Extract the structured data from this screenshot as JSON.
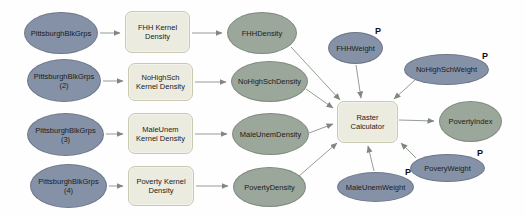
{
  "diagram": {
    "colors": {
      "input_fill": "#8591a6",
      "derived_fill": "#9aa79a",
      "tool_fill": "#ebebe0",
      "edge": "#929a92",
      "background": "#fefefe"
    },
    "nodes": {
      "pbg1": {
        "label": "PittsburghBlkGrps",
        "type": "input"
      },
      "pbg2": {
        "label": "PittsburghBlkGrps\n(2)",
        "type": "input"
      },
      "pbg3": {
        "label": "PittsburghBlkGrps\n(3)",
        "type": "input"
      },
      "pbg4": {
        "label": "PittsburghBlkGrps\n(4)",
        "type": "input"
      },
      "fhh_kd": {
        "label": "FHH Kernel\nDensity",
        "type": "tool"
      },
      "nhs_kd": {
        "label": "NoHighSch\nKernel Density",
        "type": "tool"
      },
      "mu_kd": {
        "label": "MaleUnem\nKernel Density",
        "type": "tool"
      },
      "pov_kd": {
        "label": "Poverty Kernel\nDensity",
        "type": "tool"
      },
      "fhhd": {
        "label": "FHHDensity",
        "type": "derived"
      },
      "nhsd": {
        "label": "NoHighSchDensity",
        "type": "derived"
      },
      "mud": {
        "label": "MaleUnemDensity",
        "type": "derived"
      },
      "povd": {
        "label": "PovertyDensity",
        "type": "derived"
      },
      "fhhw": {
        "label": "FHHWeight",
        "type": "input",
        "badge": "P"
      },
      "nhsw": {
        "label": "NoHighSchWeight",
        "type": "input",
        "badge": "P"
      },
      "muw": {
        "label": "MaleUnemWeight",
        "type": "input",
        "badge": "P"
      },
      "povw": {
        "label": "PoveryWeight",
        "type": "input",
        "badge": "P"
      },
      "raster_calc": {
        "label": "Raster\nCalculator",
        "type": "tool"
      },
      "povertyindex": {
        "label": "PovertyIndex",
        "type": "derived"
      }
    }
  }
}
